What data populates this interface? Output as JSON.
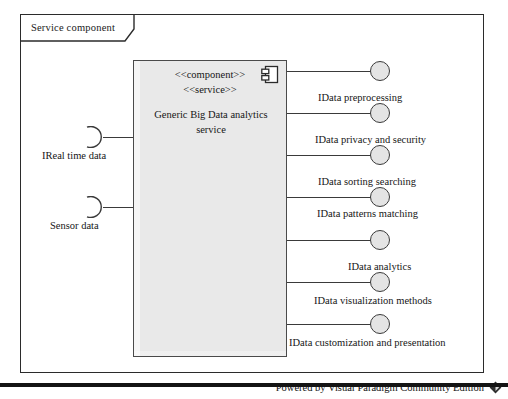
{
  "frame": {
    "label": "Service component"
  },
  "component": {
    "stereotype_1": "<<component>>",
    "stereotype_2": "<<service>>",
    "name": "Generic Big Data analytics service",
    "icon": "uml-component-icon",
    "fill_color": "#e9e9e9",
    "border_color": "#4a4a4a"
  },
  "required_interfaces": [
    {
      "label": "IReal time data",
      "y": 137
    },
    {
      "label": "Sensor data",
      "y": 207
    }
  ],
  "provided_interfaces": [
    {
      "label": "IData preprocessing",
      "y": 71,
      "label_x": 318
    },
    {
      "label": "IData privacy and security",
      "y": 113,
      "label_x": 315
    },
    {
      "label": "IData sorting searching",
      "y": 155,
      "label_x": 318
    },
    {
      "label": "IData patterns matching",
      "y": 197,
      "label_x": 317
    },
    {
      "label": "IData analytics",
      "y": 240,
      "label_x": 348
    },
    {
      "label": "IData visualization methods",
      "y": 282,
      "label_x": 314
    },
    {
      "label": "IData customization and presentation",
      "y": 324,
      "label_x": 289
    }
  ],
  "footer": {
    "text": "Powered by Visual Paradigm Community Edition",
    "logo": "visual-paradigm-diamond-logo"
  }
}
